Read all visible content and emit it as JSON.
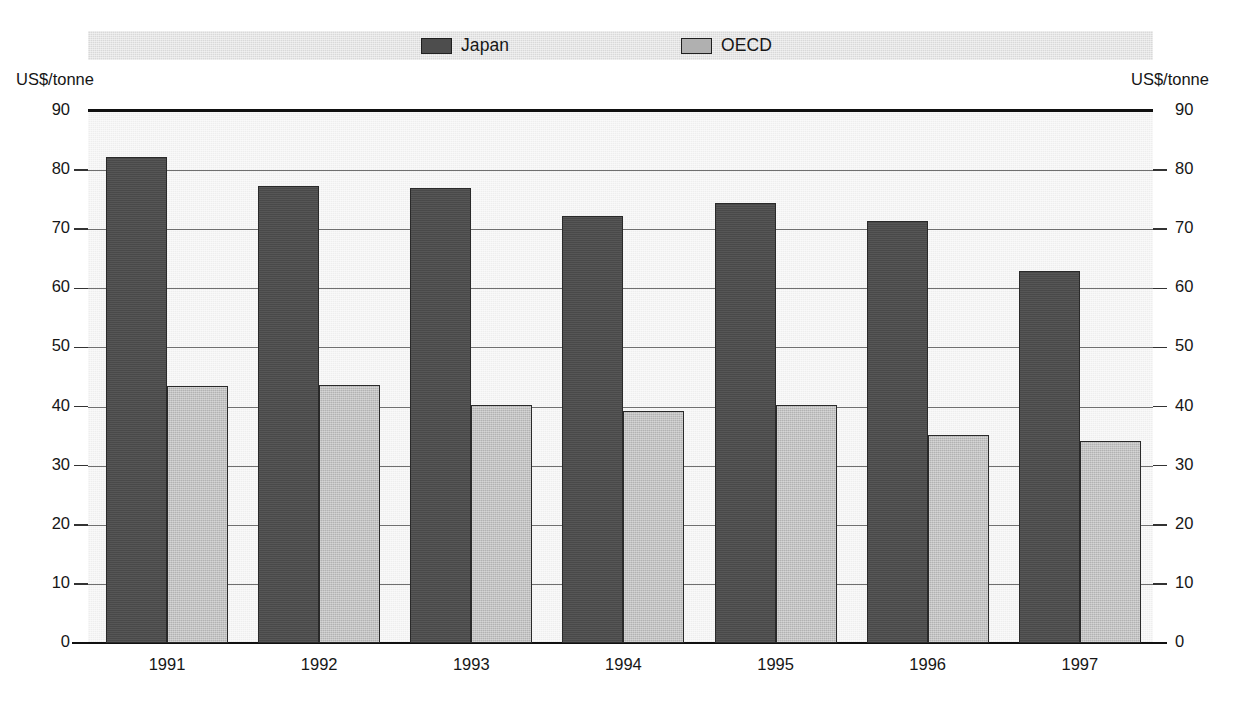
{
  "legend": {
    "items": [
      {
        "label": "Japan",
        "color": "#4d4d4d",
        "key": "japan"
      },
      {
        "label": "OECD",
        "color": "#b2b2b2",
        "key": "oecd"
      }
    ]
  },
  "axes": {
    "left_unit": "US$/tonne",
    "right_unit": "US$/tonne",
    "ticks": [
      "90",
      "80",
      "70",
      "60",
      "50",
      "40",
      "30",
      "20",
      "10",
      "0"
    ]
  },
  "chart_data": {
    "type": "bar",
    "title": "",
    "xlabel": "",
    "ylabel": "US$/tonne",
    "ylim": [
      0,
      90
    ],
    "ytick_step": 10,
    "grid": true,
    "legend_position": "top",
    "categories": [
      "1991",
      "1992",
      "1993",
      "1994",
      "1995",
      "1996",
      "1997"
    ],
    "series": [
      {
        "name": "Japan",
        "color": "#4d4d4d",
        "values": [
          82.2,
          77.3,
          77.0,
          72.3,
          74.5,
          71.4,
          62.9
        ]
      },
      {
        "name": "OECD",
        "color": "#b2b2b2",
        "values": [
          43.5,
          43.7,
          40.3,
          39.2,
          40.2,
          35.2,
          34.1
        ]
      }
    ]
  }
}
